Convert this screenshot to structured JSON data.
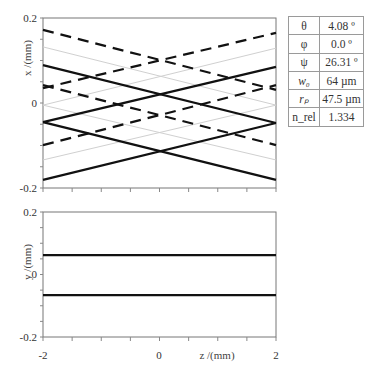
{
  "chart_data": [
    {
      "type": "line",
      "title": "",
      "xlabel": "",
      "ylabel": "x /(mm)",
      "xlim": [
        -2,
        2
      ],
      "ylim": [
        -0.2,
        0.2
      ],
      "yticks": [
        "0.2",
        "0",
        "-0.2"
      ],
      "x_minor_ticks_step": 0.5,
      "grid": false,
      "series": [
        {
          "name": "solid-1",
          "style": "solid",
          "color": "#111111",
          "x": [
            -2,
            2
          ],
          "y": [
            0.089,
            -0.047
          ]
        },
        {
          "name": "solid-2",
          "style": "solid",
          "color": "#111111",
          "x": [
            -2,
            2
          ],
          "y": [
            -0.045,
            0.085
          ]
        },
        {
          "name": "solid-3",
          "style": "solid",
          "color": "#111111",
          "x": [
            -2,
            2
          ],
          "y": [
            -0.045,
            -0.181
          ]
        },
        {
          "name": "solid-4",
          "style": "solid",
          "color": "#111111",
          "x": [
            -2,
            2
          ],
          "y": [
            -0.181,
            -0.047
          ]
        },
        {
          "name": "dashed-1",
          "style": "dashed",
          "color": "#111111",
          "x": [
            -2,
            2
          ],
          "y": [
            0.172,
            0.031
          ]
        },
        {
          "name": "dashed-2",
          "style": "dashed",
          "color": "#111111",
          "x": [
            -2,
            2
          ],
          "y": [
            0.035,
            0.165
          ]
        },
        {
          "name": "dashed-3",
          "style": "dashed",
          "color": "#111111",
          "x": [
            -2,
            2
          ],
          "y": [
            0.042,
            -0.099
          ]
        },
        {
          "name": "dashed-4",
          "style": "dashed",
          "color": "#111111",
          "x": [
            -2,
            2
          ],
          "y": [
            -0.099,
            0.042
          ]
        },
        {
          "name": "gray-1",
          "style": "thin",
          "color": "#d0d0d0",
          "x": [
            -2,
            2
          ],
          "y": [
            0.132,
            -0.005
          ]
        },
        {
          "name": "gray-2",
          "style": "thin",
          "color": "#d0d0d0",
          "x": [
            -2,
            2
          ],
          "y": [
            -0.005,
            0.129
          ]
        },
        {
          "name": "gray-3",
          "style": "thin",
          "color": "#d0d0d0",
          "x": [
            -2,
            2
          ],
          "y": [
            -0.005,
            -0.134
          ]
        },
        {
          "name": "gray-4",
          "style": "thin",
          "color": "#d0d0d0",
          "x": [
            -2,
            2
          ],
          "y": [
            -0.134,
            -0.005
          ]
        }
      ]
    },
    {
      "type": "line",
      "title": "",
      "xlabel": "z /(mm)",
      "ylabel": "y /(mm)",
      "xlim": [
        -2,
        2
      ],
      "ylim": [
        -0.2,
        0.2
      ],
      "xticks": [
        "-2",
        "0",
        "2"
      ],
      "yticks": [
        "0.2",
        "0",
        "-0.2"
      ],
      "x_minor_ticks_step": 0.5,
      "grid": false,
      "series": [
        {
          "name": "solid-upper",
          "style": "solid",
          "color": "#111111",
          "x": [
            -2,
            2
          ],
          "y": [
            0.062,
            0.062
          ]
        },
        {
          "name": "solid-lower",
          "style": "solid",
          "color": "#111111",
          "x": [
            -2,
            2
          ],
          "y": [
            -0.066,
            -0.066
          ]
        }
      ]
    }
  ],
  "top_plot": {
    "ylabel": "x /(mm)",
    "ytick_top": "0.2",
    "ytick_mid": "0",
    "ytick_bottom": "-0.2"
  },
  "bottom_plot": {
    "ylabel": "y /(mm)",
    "ytick_top": "0.2",
    "ytick_mid": "0",
    "ytick_bottom": "-0.2",
    "xtick_left": "-2",
    "xtick_mid": "0",
    "xtick_right": "2",
    "xlabel": "z /(mm)"
  },
  "parameters": [
    {
      "symbol": "θ",
      "value": "4.08 º"
    },
    {
      "symbol": "φ",
      "value": "0.0 º"
    },
    {
      "symbol": "ψ",
      "value": "26.31 º"
    },
    {
      "symbol": "w₀",
      "value": "64 µm"
    },
    {
      "symbol": "rₚ",
      "value": "47.5 µm"
    },
    {
      "symbol": "n_rel",
      "value": "1.334"
    }
  ]
}
